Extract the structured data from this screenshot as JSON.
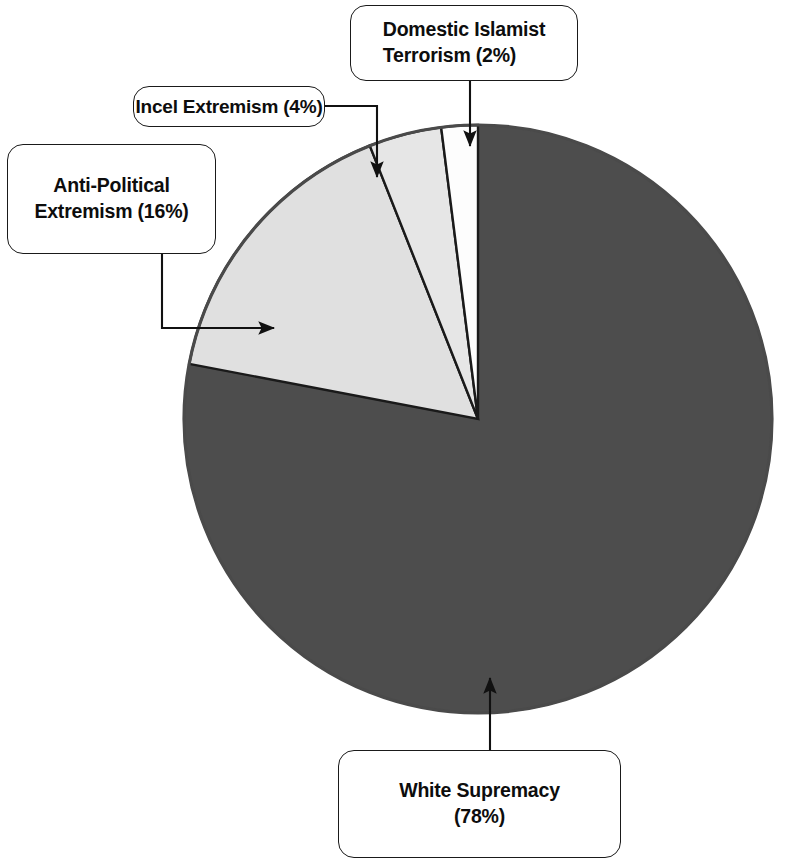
{
  "figure": {
    "title": "",
    "background_color": "#ffffff"
  },
  "chart_data": {
    "type": "pie",
    "title": "",
    "xlabel": "",
    "ylabel": "",
    "legend_position": "callout-labels",
    "grid": false,
    "units": "percent",
    "start_angle_deg": 90,
    "direction": "counterclockwise",
    "categories": [
      "Domestic Islamist Terrorism",
      "Incel Extremism",
      "Anti-Political Extremism",
      "White Supremacy"
    ],
    "values": [
      2,
      4,
      16,
      78
    ],
    "labels": [
      "Domestic Islamist\nTerrorism (2%)",
      "Incel Extremism (4%)",
      "Anti-Political\nExtremism (16%)",
      "White Supremacy\n(78%)"
    ],
    "slice_colors": [
      "#fdfdfd",
      "#e6e6e6",
      "#e0e0e0",
      "#4d4d4d"
    ],
    "outline_color": "#1a1a1a",
    "slices": [
      {
        "name": "Domestic Islamist Terrorism",
        "value": 2,
        "color": "#fdfdfd"
      },
      {
        "name": "Incel Extremism",
        "value": 4,
        "color": "#e6e6e6"
      },
      {
        "name": "Anti-Political Extremism",
        "value": 16,
        "color": "#e0e0e0"
      },
      {
        "name": "White Supremacy",
        "value": 78,
        "color": "#4d4d4d"
      }
    ]
  },
  "callouts": {
    "domestic": {
      "label": "Domestic Islamist\nTerrorism (2%)",
      "value_text": "2%"
    },
    "incel": {
      "label": "Incel Extremism (4%)",
      "value_text": "4%"
    },
    "antipolitical": {
      "label": "Anti-Political\nExtremism (16%)",
      "value_text": "16%"
    },
    "whitesupremacy": {
      "label": "White Supremacy\n(78%)",
      "value_text": "78%"
    }
  }
}
